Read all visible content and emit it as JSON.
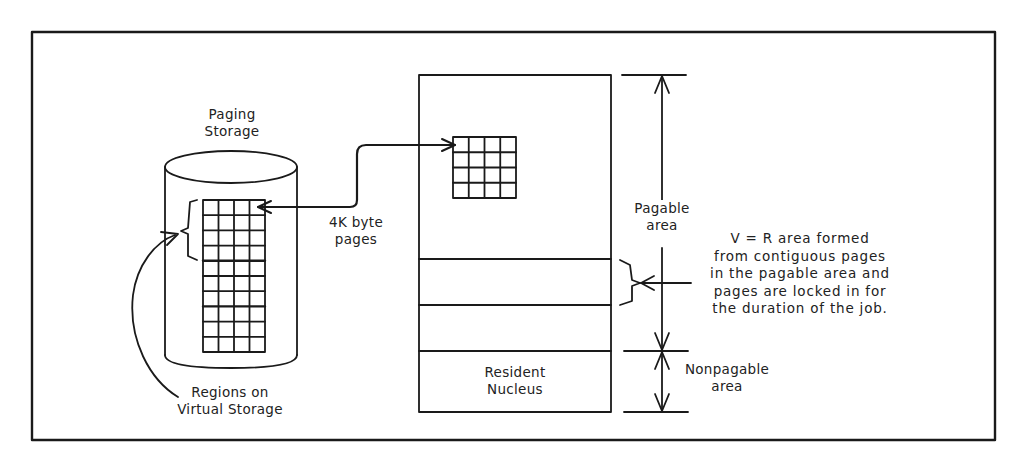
{
  "diagram": {
    "type": "virtual-storage-paging-diagram",
    "colors": {
      "line": "#1a1a1a",
      "text": "#222222",
      "background": "#ffffff"
    },
    "labels": {
      "paging_storage": [
        "Paging",
        "Storage"
      ],
      "page_size": [
        "4K byte",
        "pages"
      ],
      "regions": [
        "Regions on",
        "Virtual Storage"
      ],
      "pagable_area": [
        "Pagable",
        "area"
      ],
      "vr_area_note": [
        "V = R area formed",
        "from contiguous pages",
        "in the pagable area and",
        "pages are locked in for",
        "the duration of the job."
      ],
      "resident_nucleus": [
        "Resident",
        "Nucleus"
      ],
      "nonpagable_area": [
        "Nonpagable",
        "area"
      ]
    },
    "components": {
      "paging_storage_cylinder": {
        "grid_columns": 4,
        "grid_rows": 10,
        "region_groups_rows": [
          4,
          3,
          3
        ]
      },
      "real_storage_box": {
        "page_grid": {
          "columns": 4,
          "rows": 4
        },
        "sections": [
          "pagable-area",
          "v-equals-r-area",
          "pagable-area-lower",
          "resident-nucleus"
        ]
      }
    },
    "connections": [
      {
        "from": "paging-storage-region-grid",
        "to": "real-storage-page-grid",
        "label": "4K byte pages",
        "bidirectional": true
      },
      {
        "from": "regions-label",
        "to": "region-brace"
      },
      {
        "from": "vr-note",
        "to": "vr-area-brace"
      }
    ]
  }
}
